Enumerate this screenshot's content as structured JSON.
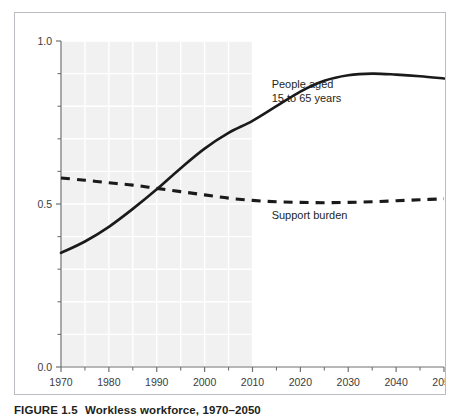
{
  "figure": {
    "caption_number": "FIGURE 1.5",
    "caption_title": "Workless workforce, 1970–2050",
    "caption_full": "FIGURE 1.5  Workless workforce, 1970–2050"
  },
  "colors": {
    "frame_border": "#b9bcc0",
    "axis": "#6f7175",
    "curve": "#1a1a1a",
    "shaded_band": "#f1f1f1",
    "gridline": "#ffffff",
    "tick_label": "#3b3b3d",
    "label_text": "#231f20",
    "background": "#ffffff"
  },
  "chart_data": {
    "type": "line",
    "title": "",
    "subtitle": "",
    "xlabel": "",
    "ylabel": "",
    "xlim": [
      1970,
      2050
    ],
    "ylim": [
      0.0,
      1.0
    ],
    "grid": true,
    "grid_style": "white gridlines over light gray band",
    "legend_position": "inline labels next to curves",
    "x_ticks_major": [
      1970,
      1980,
      1990,
      2000,
      2010,
      2020,
      2030,
      2040,
      2050
    ],
    "x_tick_labels": [
      "1970",
      "1980",
      "1990",
      "2000",
      "2010",
      "2020",
      "2030",
      "2040",
      "2050"
    ],
    "x_ticks_minor": [
      1975,
      1985,
      1995,
      2005,
      2015,
      2025,
      2035,
      2045
    ],
    "y_ticks_major": [
      0.0,
      0.5,
      1.0
    ],
    "y_tick_labels": [
      "0.0",
      "0.5",
      "1.0"
    ],
    "y_ticks_minor": [
      0.1,
      0.2,
      0.3,
      0.4,
      0.6,
      0.7,
      0.8,
      0.9
    ],
    "shaded_region": {
      "label": "historical period",
      "x_start": 1970,
      "x_end": 2010
    },
    "x": [
      1970,
      1975,
      1980,
      1985,
      1990,
      1995,
      2000,
      2005,
      2010,
      2015,
      2020,
      2025,
      2030,
      2035,
      2040,
      2045,
      2050
    ],
    "series": [
      {
        "name": "People aged 15 to 65 years",
        "style": "solid",
        "label_lines": [
          "People aged",
          "15 to 65 years"
        ],
        "label_x": 2014,
        "label_y": 0.855,
        "values": [
          0.35,
          0.385,
          0.43,
          0.485,
          0.545,
          0.61,
          0.67,
          0.718,
          0.755,
          0.8,
          0.845,
          0.878,
          0.895,
          0.9,
          0.897,
          0.892,
          0.885
        ]
      },
      {
        "name": "Support burden",
        "style": "dashed",
        "label_lines": [
          "Support burden"
        ],
        "label_x": 2014,
        "label_y": 0.455,
        "values": [
          0.58,
          0.573,
          0.565,
          0.558,
          0.548,
          0.538,
          0.528,
          0.518,
          0.511,
          0.507,
          0.505,
          0.504,
          0.505,
          0.507,
          0.51,
          0.513,
          0.516
        ]
      }
    ]
  }
}
